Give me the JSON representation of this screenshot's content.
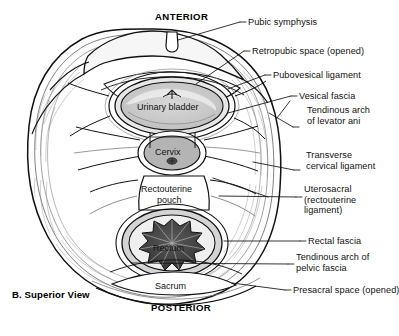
{
  "figure": {
    "caption": "B. Superior View",
    "orientation_top": "ANTERIOR",
    "orientation_bottom": "POSTERIOR"
  },
  "colors": {
    "ink": "#111111",
    "background": "#ffffff",
    "bladder_fill": "#c9c9c9",
    "bladder_rim": "#e3e3e3",
    "cervix_fill": "#b4b4b4",
    "rectum_folds": "#3c3c3c",
    "rectum_rim": "#cfcfcf",
    "fascia_band": "#9a9a9a",
    "bone_fill": "#ededed"
  },
  "internal_labels": [
    {
      "name": "urinary-bladder",
      "text": "Urinary bladder",
      "x": 177,
      "y": 107
    },
    {
      "name": "cervix",
      "text": "Cervix",
      "x": 172,
      "y": 152
    },
    {
      "name": "rectouterine-pouch-line1",
      "text": "Rectouterine",
      "x": 172,
      "y": 190
    },
    {
      "name": "rectouterine-pouch-line2",
      "text": "pouch",
      "x": 172,
      "y": 201
    },
    {
      "name": "rectum",
      "text": "Rectum",
      "x": 175,
      "y": 248
    },
    {
      "name": "sacrum",
      "text": "Sacrum",
      "x": 176,
      "y": 286
    }
  ],
  "callouts": [
    {
      "name": "pubic-symphysis",
      "text": "Pubic symphysis",
      "x": 247,
      "y": 17,
      "lines": 1
    },
    {
      "name": "retropubic-space",
      "text": "Retropubic space (opened)",
      "x": 251,
      "y": 47,
      "lines": 1
    },
    {
      "name": "pubovesical-ligament",
      "text": "Pubovesical ligament",
      "x": 272,
      "y": 70,
      "lines": 1
    },
    {
      "name": "vesical-fascia",
      "text": "Vesical fascia",
      "x": 298,
      "y": 92,
      "lines": 1
    },
    {
      "name": "tendinous-arch-levator-ani",
      "text": "Tendinous arch of levator ani",
      "x": 306,
      "y": 112,
      "lines": 3
    },
    {
      "name": "transverse-cervical-ligament",
      "text": "Transverse cervical ligament",
      "x": 305,
      "y": 156,
      "lines": 2
    },
    {
      "name": "uterosacral-ligament",
      "text": "Uterosacral (rectouterine ligament)",
      "x": 303,
      "y": 190,
      "lines": 3
    },
    {
      "name": "rectal-fascia",
      "text": "Rectal fascia",
      "x": 307,
      "y": 237,
      "lines": 1
    },
    {
      "name": "tendinous-arch-pelvic-fascia",
      "text": "Tendinous arch of pelvic fascia",
      "x": 295,
      "y": 255,
      "lines": 2
    },
    {
      "name": "presacral-space",
      "text": "Presacral space (opened)",
      "x": 292,
      "y": 286,
      "lines": 1
    }
  ]
}
